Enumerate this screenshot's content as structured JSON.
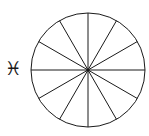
{
  "figure": {
    "name": "zodiac-sector-wheel",
    "background_color": "#ffffff",
    "stroke_color": "#1a1a1a",
    "stroke_width": 1
  },
  "symbol": {
    "icon_name": "pisces-icon",
    "glyph": "♓",
    "label": "Pisces",
    "color": "#1a1a1a"
  },
  "chart_data": {
    "type": "pie",
    "title": "",
    "xlabel": "",
    "ylabel": "",
    "legend": "none",
    "grid": false,
    "center": {
      "x": 88,
      "y": 70
    },
    "radius": 57,
    "slice_count": 12,
    "slice_angle_degrees": 30,
    "categories": [
      "1",
      "2",
      "3",
      "4",
      "5",
      "6",
      "7",
      "8",
      "9",
      "10",
      "11",
      "12"
    ],
    "values": [
      30,
      30,
      30,
      30,
      30,
      30,
      30,
      30,
      30,
      30,
      30,
      30
    ],
    "spoke_angles_degrees": [
      0,
      30,
      60,
      90,
      120,
      150,
      180,
      210,
      240,
      270,
      300,
      330
    ]
  }
}
